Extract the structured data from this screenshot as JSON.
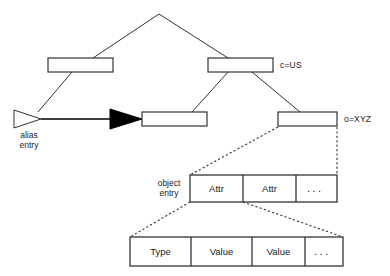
{
  "diagram": {
    "nodes": {
      "root": {
        "name": "root-node",
        "label": ""
      },
      "left_mid": {
        "name": "left-middle-node",
        "label": ""
      },
      "right_mid": {
        "name": "right-middle-node",
        "label": "c=US"
      },
      "center_leaf": {
        "name": "center-leaf-node",
        "label": ""
      },
      "right_leaf": {
        "name": "right-leaf-node",
        "label": "o=XYZ"
      }
    },
    "labels": {
      "c_us": "c=US",
      "o_xyz": "o=XYZ",
      "alias_entry_line1": "alias",
      "alias_entry_line2": "entry",
      "object_entry_line1": "object",
      "object_entry_line2": "entry"
    },
    "attr_row": {
      "name": "object-entry-attribute-row",
      "cells": [
        "Attr",
        "Attr",
        "..."
      ]
    },
    "value_row": {
      "name": "attribute-type-value-row",
      "cells": [
        "Type",
        "Value",
        "Value",
        "..."
      ]
    },
    "colors": {
      "stroke": "#333333",
      "fill": "#ffffff",
      "arrow_fill": "#000000",
      "text": "#1a1a1a"
    }
  }
}
